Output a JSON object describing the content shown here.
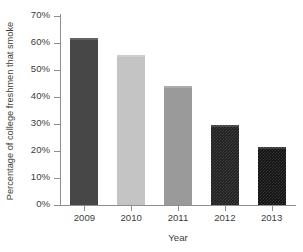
{
  "chart_data": {
    "type": "bar",
    "title": "",
    "subtitle": "",
    "xlabel": "Year",
    "ylabel": "Percentage of college freshmen that smoke",
    "categories": [
      "2009",
      "2010",
      "2011",
      "2012",
      "2013"
    ],
    "values": [
      62,
      55.5,
      44,
      29.8,
      21.5
    ],
    "value_labels": [
      "62%",
      "55.5%",
      "44%",
      "29.8%",
      "21.5%"
    ],
    "series": [
      {
        "name": "Percentage of college freshmen that smoke",
        "values": [
          62,
          55.5,
          44,
          29.8,
          21.5
        ]
      }
    ],
    "ylim": [
      0,
      70
    ],
    "ytick_step": 10,
    "ytick_values": [
      70,
      60,
      50,
      40,
      30,
      20,
      10,
      0
    ],
    "ytick_labels": [
      "70%",
      "60%",
      "50%",
      "40%",
      "30%",
      "20%",
      "10%",
      "0%"
    ],
    "xtick_labels": [
      "2009",
      "2010",
      "2011",
      "2012",
      "2013"
    ],
    "grid": false,
    "legend": false,
    "legend_position": "none",
    "bar_fills": [
      "#474747",
      "#c4c4c4",
      "#9a9a9a",
      "#1f1f1f",
      "#111111"
    ],
    "bar_textures": [
      "solid",
      "solid",
      "solid",
      "checker-dither",
      "checker-dither"
    ],
    "annotations": [],
    "background_color": "#ffffff",
    "axis_color": "#8e8e8e",
    "text_color": "#3d3d3d"
  },
  "axes": {
    "y": {
      "title": "Percentage of college freshmen that smoke",
      "ticks": [
        {
          "label": "70%",
          "value": 70
        },
        {
          "label": "60%",
          "value": 60
        },
        {
          "label": "50%",
          "value": 50
        },
        {
          "label": "40%",
          "value": 40
        },
        {
          "label": "30%",
          "value": 30
        },
        {
          "label": "20%",
          "value": 20
        },
        {
          "label": "10%",
          "value": 10
        },
        {
          "label": "0%",
          "value": 0
        }
      ]
    },
    "x": {
      "title": "Year",
      "ticks": [
        {
          "label": "2009"
        },
        {
          "label": "2010"
        },
        {
          "label": "2011"
        },
        {
          "label": "2012"
        },
        {
          "label": "2013"
        }
      ]
    }
  },
  "bars": [
    {
      "category": "2009",
      "value": 62,
      "fill": "#474747",
      "texture": "solid"
    },
    {
      "category": "2010",
      "value": 55.5,
      "fill": "#c4c4c4",
      "texture": "solid"
    },
    {
      "category": "2011",
      "value": 44,
      "fill": "#9a9a9a",
      "texture": "solid"
    },
    {
      "category": "2012",
      "value": 29.8,
      "fill": "#1f1f1f",
      "texture": "checker-dither"
    },
    {
      "category": "2013",
      "value": 21.5,
      "fill": "#111111",
      "texture": "checker-dither"
    }
  ]
}
